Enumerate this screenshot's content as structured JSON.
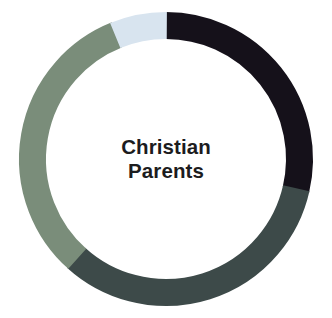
{
  "figure": {
    "center_label_line1": "Christian",
    "center_label_line2": "Parents",
    "background_color": "#ffffff",
    "label_color": "#1c1c1e"
  },
  "chart_data": {
    "type": "pie",
    "variant": "donut",
    "title": "Christian Parents",
    "subtitle": "",
    "xlabel": "",
    "ylabel": "",
    "grid": false,
    "legend_position": "none",
    "data_labels_shown": false,
    "center_text": [
      "Christian",
      "Parents"
    ],
    "geometry": {
      "center_x": 166,
      "center_y": 159,
      "outer_radius": 147,
      "inner_radius": 120,
      "ring_thickness": 27,
      "start_angle_deg": 0,
      "direction": "clockwise"
    },
    "categories": [
      "Segment 1",
      "Segment 2",
      "Segment 3",
      "Segment 4"
    ],
    "values": [
      28.6,
      33.1,
      32.2,
      6.1
    ],
    "slices": [
      {
        "name": "Segment 1",
        "color": "#15111a",
        "value": 28.6,
        "start_angle_deg": 0,
        "end_angle_deg": 103,
        "sweep_deg": 103
      },
      {
        "name": "Segment 2",
        "color": "#3d4a49",
        "value": 33.1,
        "start_angle_deg": 103,
        "end_angle_deg": 222,
        "sweep_deg": 119
      },
      {
        "name": "Segment 3",
        "color": "#7a8d7a",
        "value": 32.2,
        "start_angle_deg": 222,
        "end_angle_deg": 338,
        "sweep_deg": 116
      },
      {
        "name": "Segment 4",
        "color": "#d8e4ef",
        "value": 6.1,
        "start_angle_deg": 338,
        "end_angle_deg": 360,
        "sweep_deg": 22
      }
    ],
    "colors": [
      "#15111a",
      "#3d4a49",
      "#7a8d7a",
      "#d8e4ef"
    ]
  }
}
